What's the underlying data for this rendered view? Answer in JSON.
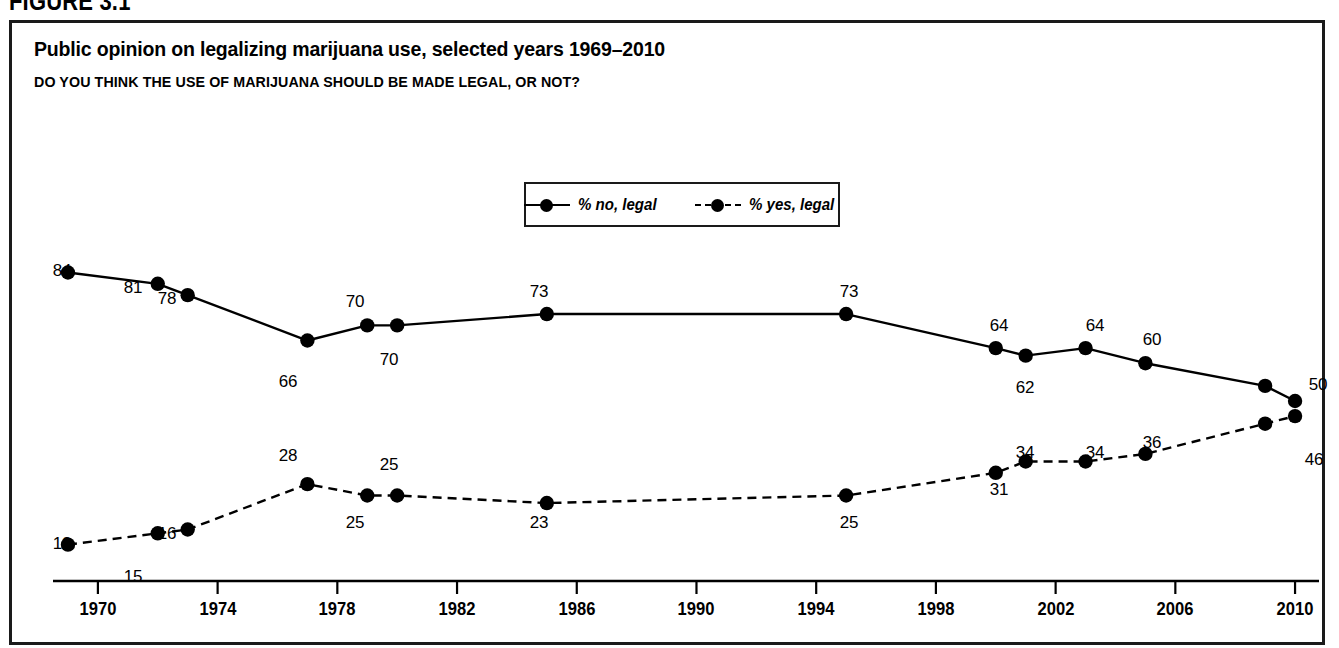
{
  "figure": {
    "number_label": "FIGURE 3.1",
    "title": "Public opinion on legalizing marijuana use, selected years 1969–2010",
    "subtitle": "DO YOU THINK THE USE OF MARIJUANA SHOULD BE MADE LEGAL, OR NOT?"
  },
  "legend": {
    "position": "top-center",
    "entries": [
      {
        "label": "% no, legal",
        "style": "solid",
        "marker": "filled-circle",
        "color": "#000000"
      },
      {
        "label": "% yes, legal",
        "style": "dashed",
        "marker": "filled-circle",
        "color": "#000000"
      }
    ]
  },
  "axis": {
    "x_ticks": [
      "1970",
      "1974",
      "1978",
      "1982",
      "1986",
      "1990",
      "1994",
      "1998",
      "2002",
      "2006",
      "2010"
    ],
    "x_tick_values": [
      1970,
      1974,
      1978,
      1982,
      1986,
      1990,
      1994,
      1998,
      2002,
      2006,
      2010
    ],
    "y_axis_visible": false,
    "grid": false
  },
  "chart_data": {
    "type": "line",
    "title": "Public opinion on legalizing marijuana use, selected years 1969–2010",
    "subtitle": "DO YOU THINK THE USE OF MARIJUANA SHOULD BE MADE LEGAL, OR NOT?",
    "xlabel": "",
    "ylabel": "",
    "xlim": [
      1968.5,
      2010.8
    ],
    "ylim": [
      0,
      92
    ],
    "grid": false,
    "legend_position": "top-center",
    "x": [
      1969,
      1972,
      1973,
      1977,
      1979,
      1980,
      1985,
      1995,
      2000,
      2001,
      2003,
      2005,
      2009,
      2010
    ],
    "series": [
      {
        "name": "% no, legal",
        "style": "solid",
        "marker": "filled-circle",
        "color": "#000000",
        "values": [
          84,
          81,
          78,
          66,
          70,
          70,
          73,
          73,
          64,
          62,
          64,
          60,
          54,
          50
        ],
        "labels": [
          "84",
          "81",
          "78",
          "66",
          "70",
          "70",
          "73",
          "73",
          "64",
          "62",
          "64",
          "60",
          "",
          "50"
        ],
        "label_positions": [
          "above",
          "above",
          "above",
          "below",
          "above",
          "below",
          "above",
          "above",
          "above",
          "below",
          "above",
          "above",
          "",
          "right"
        ]
      },
      {
        "name": "% yes, legal",
        "style": "dashed",
        "marker": "filled-circle",
        "color": "#000000",
        "values": [
          12,
          15,
          16,
          28,
          25,
          25,
          23,
          25,
          31,
          34,
          34,
          36,
          44,
          46
        ],
        "labels": [
          "12",
          "15",
          "16",
          "28",
          "25",
          "25",
          "23",
          "25",
          "31",
          "34",
          "34",
          "36",
          "",
          "46"
        ],
        "label_positions": [
          "above",
          "below",
          "above",
          "above",
          "below",
          "above",
          "below",
          "below",
          "below",
          "above",
          "above",
          "above",
          "",
          "right"
        ]
      }
    ]
  },
  "point_labels": [
    {
      "text": "84",
      "x": 50,
      "y": 238
    },
    {
      "text": "81",
      "x": 121,
      "y": 255
    },
    {
      "text": "78",
      "x": 155,
      "y": 266
    },
    {
      "text": "66",
      "x": 276,
      "y": 349
    },
    {
      "text": "70",
      "x": 343,
      "y": 269
    },
    {
      "text": "70",
      "x": 377,
      "y": 327
    },
    {
      "text": "73",
      "x": 527,
      "y": 259
    },
    {
      "text": "73",
      "x": 837,
      "y": 259
    },
    {
      "text": "64",
      "x": 987,
      "y": 293
    },
    {
      "text": "62",
      "x": 1013,
      "y": 355
    },
    {
      "text": "64",
      "x": 1083,
      "y": 293
    },
    {
      "text": "60",
      "x": 1140,
      "y": 307
    },
    {
      "text": "50",
      "x": 1306,
      "y": 352
    },
    {
      "text": "12",
      "x": 50,
      "y": 511
    },
    {
      "text": "15",
      "x": 121,
      "y": 544
    },
    {
      "text": "16",
      "x": 155,
      "y": 501
    },
    {
      "text": "28",
      "x": 276,
      "y": 423
    },
    {
      "text": "25",
      "x": 343,
      "y": 490
    },
    {
      "text": "25",
      "x": 377,
      "y": 432
    },
    {
      "text": "23",
      "x": 527,
      "y": 490
    },
    {
      "text": "25",
      "x": 837,
      "y": 490
    },
    {
      "text": "31",
      "x": 987,
      "y": 457
    },
    {
      "text": "34",
      "x": 1013,
      "y": 420
    },
    {
      "text": "34",
      "x": 1083,
      "y": 420
    },
    {
      "text": "36",
      "x": 1140,
      "y": 410
    },
    {
      "text": "46",
      "x": 1302,
      "y": 427
    }
  ],
  "colors": {
    "line": "#000000",
    "border": "#1a1a1a",
    "background": "#ffffff",
    "text": "#000000"
  }
}
